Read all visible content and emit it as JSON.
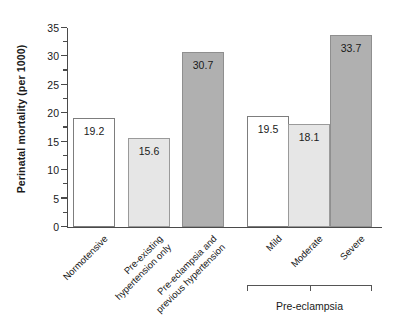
{
  "chart_data": {
    "type": "bar",
    "title": "",
    "xlabel": "",
    "ylabel": "Perinatal mortality (per 1000)",
    "ylim": [
      0,
      35
    ],
    "grid": false,
    "legend": "none",
    "categories": [
      "Normotensive",
      "Pre-existing hypertension only",
      "Pre-eclampsia and previous hypertension",
      "Mild",
      "Moderate",
      "Severe"
    ],
    "values": [
      19.2,
      15.6,
      30.7,
      19.5,
      18.1,
      33.7
    ],
    "value_labels": [
      "19.2",
      "15.6",
      "30.7",
      "19.5",
      "18.1",
      "33.7"
    ],
    "bar_fills": [
      "white",
      "light",
      "dark",
      "white",
      "light",
      "dark"
    ],
    "y_ticks_major": [
      0,
      5,
      10,
      15,
      20,
      25,
      30,
      35
    ],
    "y_tick_labels": [
      "0",
      "5",
      "10",
      "15",
      "20",
      "25",
      "30",
      "35"
    ],
    "y_ticks_minor": [
      2.5,
      7.5,
      12.5,
      17.5,
      22.5,
      27.5,
      32.5
    ],
    "group_bracket": {
      "label": "Pre-eclampsia",
      "covers": [
        "Mild",
        "Moderate",
        "Severe"
      ]
    },
    "colors": {
      "fill_white": "#ffffff",
      "fill_light": "#e6e6e6",
      "fill_dark": "#b0b0b0",
      "axis": "#4a4a4a",
      "text": "#1a1a1a"
    }
  },
  "category_label_lines": [
    {
      "line1": "Normotensive",
      "line2": ""
    },
    {
      "line1": "Pre-existing",
      "line2": "hypertension only"
    },
    {
      "line1": "Pre-eclampsia and",
      "line2": "previous hypertension"
    },
    {
      "line1": "Mild",
      "line2": ""
    },
    {
      "line1": "Moderate",
      "line2": ""
    },
    {
      "line1": "Severe",
      "line2": ""
    }
  ]
}
